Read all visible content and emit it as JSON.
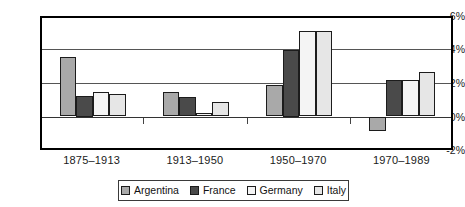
{
  "chart_data": {
    "type": "bar",
    "title": "",
    "subtitle": "",
    "xlabel": "",
    "ylabel": "",
    "categories": [
      "1875–1913",
      "1913–1950",
      "1950–1970",
      "1970–1989"
    ],
    "series": [
      {
        "name": "Argentina",
        "color": "#a9a9a9",
        "values": [
          3.55,
          1.45,
          1.9,
          -0.85
        ]
      },
      {
        "name": "France",
        "color": "#4a4a4a",
        "values": [
          1.25,
          1.15,
          4.0,
          2.2
        ]
      },
      {
        "name": "Germany",
        "color": "#f4f4f4",
        "values": [
          1.45,
          0.2,
          5.1,
          2.2
        ]
      },
      {
        "name": "Italy",
        "color": "#e6e6e6",
        "values": [
          1.35,
          0.85,
          5.1,
          2.65
        ]
      }
    ],
    "ylim": [
      -2,
      6
    ],
    "yticks": [
      6,
      4,
      2,
      0,
      -2
    ],
    "ytick_labels": [
      "6%",
      "4%",
      "2%",
      "0%",
      "-2%"
    ],
    "grid": true,
    "legend_position": "bottom",
    "value_suffix": "%"
  },
  "axis": {
    "y": {
      "labels": [
        "6%",
        "4%",
        "2%",
        "0%",
        "-2%"
      ]
    },
    "x": {
      "labels": [
        "1875–1913",
        "1913–1950",
        "1950–1970",
        "1970–1989"
      ]
    }
  },
  "legend": {
    "items": [
      {
        "label": "Argentina"
      },
      {
        "label": "France"
      },
      {
        "label": "Germany"
      },
      {
        "label": "Italy"
      }
    ]
  }
}
